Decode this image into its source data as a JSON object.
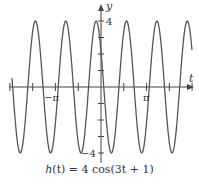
{
  "chart_data": {
    "type": "line",
    "title": "h(t) = 4 cos(3t + 1)",
    "function": "h(t) = 4cos(3t+1)",
    "xlabel": "t",
    "ylabel": "y",
    "xlim": [
      -6.2,
      6.2
    ],
    "ylim": [
      -4.4,
      4.4
    ],
    "x_ticks": {
      "step": "pi/2",
      "labeled": [
        {
          "value": -3.14159,
          "label": "−π"
        },
        {
          "value": 3.14159,
          "label": "π"
        }
      ]
    },
    "y_ticks": {
      "step": 1,
      "labeled": [
        {
          "value": 4,
          "label": "4"
        },
        {
          "value": -4,
          "label": "−4"
        }
      ]
    },
    "series": [
      {
        "name": "h(t)",
        "amplitude": 4,
        "angular_frequency": 3,
        "phase": 1,
        "color": "#555555"
      }
    ],
    "grid": false,
    "legend": null
  },
  "labels": {
    "y_axis": "y",
    "t_axis": "t",
    "y_max": "4",
    "y_min": "−4",
    "neg_pi": "−π",
    "pi": "π",
    "caption_h": "h",
    "caption_rest": "(t) = 4 cos(3t + 1)"
  }
}
